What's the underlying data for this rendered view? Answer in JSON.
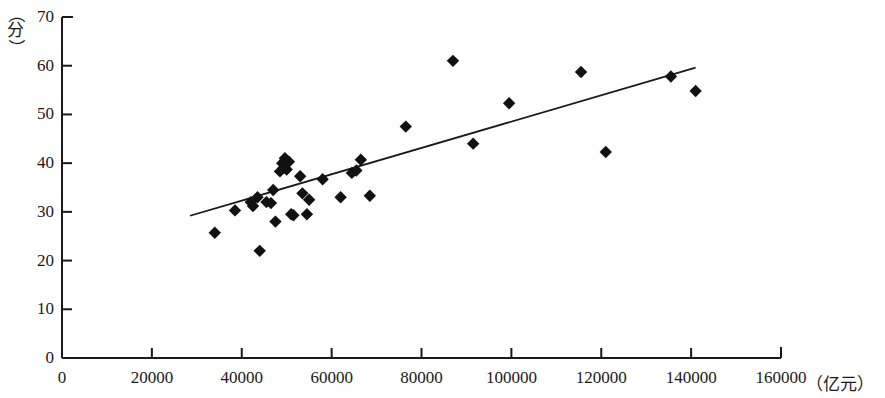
{
  "chart_data": {
    "type": "scatter",
    "title": "",
    "subtitle": "",
    "xlabel": "（亿元）",
    "ylabel": "（分）",
    "xlim": [
      0,
      160000
    ],
    "ylim": [
      0,
      70
    ],
    "grid": false,
    "legend": null,
    "x_ticks": [
      0,
      20000,
      40000,
      60000,
      80000,
      100000,
      120000,
      140000,
      160000
    ],
    "x_tick_labels": [
      "0",
      "20000",
      "40000",
      "60000",
      "80000",
      "100000",
      "120000",
      "140000",
      "160000"
    ],
    "y_ticks": [
      0,
      10,
      20,
      30,
      40,
      50,
      60,
      70
    ],
    "y_tick_labels": [
      "0",
      "10",
      "20",
      "30",
      "40",
      "50",
      "60",
      "70"
    ],
    "marker": "diamond",
    "marker_color": "#111111",
    "points": [
      {
        "x": 34000,
        "y": 25.7
      },
      {
        "x": 38500,
        "y": 30.3
      },
      {
        "x": 42000,
        "y": 32.0
      },
      {
        "x": 42500,
        "y": 31.2
      },
      {
        "x": 43500,
        "y": 33.0
      },
      {
        "x": 44000,
        "y": 22.0
      },
      {
        "x": 45500,
        "y": 32.0
      },
      {
        "x": 46500,
        "y": 31.8
      },
      {
        "x": 47000,
        "y": 34.5
      },
      {
        "x": 47500,
        "y": 28.0
      },
      {
        "x": 48500,
        "y": 38.3
      },
      {
        "x": 49000,
        "y": 40.0
      },
      {
        "x": 49300,
        "y": 39.0
      },
      {
        "x": 49600,
        "y": 41.0
      },
      {
        "x": 50000,
        "y": 38.7
      },
      {
        "x": 50500,
        "y": 40.3
      },
      {
        "x": 51000,
        "y": 29.5
      },
      {
        "x": 51500,
        "y": 29.3
      },
      {
        "x": 53000,
        "y": 37.3
      },
      {
        "x": 53500,
        "y": 33.8
      },
      {
        "x": 54500,
        "y": 29.5
      },
      {
        "x": 55000,
        "y": 32.5
      },
      {
        "x": 58000,
        "y": 36.7
      },
      {
        "x": 62000,
        "y": 33.0
      },
      {
        "x": 64500,
        "y": 38.0
      },
      {
        "x": 65500,
        "y": 38.5
      },
      {
        "x": 66500,
        "y": 40.7
      },
      {
        "x": 68500,
        "y": 33.3
      },
      {
        "x": 76500,
        "y": 47.5
      },
      {
        "x": 87000,
        "y": 61.0
      },
      {
        "x": 91500,
        "y": 44.0
      },
      {
        "x": 99500,
        "y": 52.3
      },
      {
        "x": 115500,
        "y": 58.7
      },
      {
        "x": 121000,
        "y": 42.3
      },
      {
        "x": 135500,
        "y": 57.8
      },
      {
        "x": 141000,
        "y": 54.8
      }
    ],
    "trend_line": {
      "type": "linear_fit",
      "x_start": 28500,
      "y_start": 29.2,
      "x_end": 141000,
      "y_end": 59.6
    }
  }
}
